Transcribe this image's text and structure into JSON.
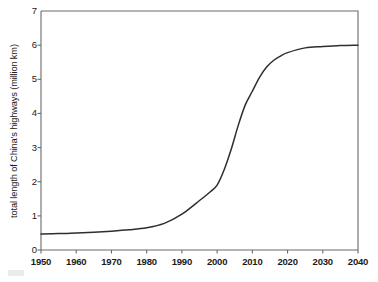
{
  "chart_data": {
    "type": "line",
    "title": "",
    "subtitle": "",
    "xlabel": "",
    "ylabel": "total length of China's highways (million km)",
    "xlim": [
      1950,
      2040
    ],
    "ylim": [
      0,
      7
    ],
    "xticks": [
      1950,
      1960,
      1970,
      1980,
      1990,
      2000,
      2010,
      2020,
      2030,
      2040
    ],
    "yticks": [
      0,
      1,
      2,
      3,
      4,
      5,
      6,
      7
    ],
    "xtick_labels": [
      "1950",
      "1960",
      "1970",
      "1980",
      "1990",
      "2000",
      "2010",
      "2020",
      "2030",
      "2040"
    ],
    "ytick_labels": [
      "0",
      "1",
      "2",
      "3",
      "4",
      "5",
      "6",
      "7"
    ],
    "grid": false,
    "legend": false,
    "legend_position": "none",
    "line_color": "#2e2e2e",
    "axis_color": "#6b6b6b",
    "background_color": "#ffffff",
    "series": [
      {
        "name": "total length of China's highways",
        "x": [
          1950,
          1955,
          1960,
          1965,
          1970,
          1975,
          1980,
          1985,
          1990,
          1995,
          1998,
          2000,
          2002,
          2004,
          2006,
          2008,
          2010,
          2012,
          2014,
          2016,
          2018,
          2020,
          2025,
          2030,
          2035,
          2040
        ],
        "values": [
          0.47,
          0.48,
          0.5,
          0.52,
          0.55,
          0.59,
          0.65,
          0.78,
          1.05,
          1.45,
          1.7,
          1.9,
          2.35,
          2.95,
          3.65,
          4.25,
          4.65,
          5.05,
          5.35,
          5.55,
          5.68,
          5.78,
          5.92,
          5.96,
          5.99,
          6.0
        ]
      }
    ],
    "annotations": []
  },
  "axes": {
    "y_title": "total length of China's highways (million km)",
    "x_title": ""
  }
}
